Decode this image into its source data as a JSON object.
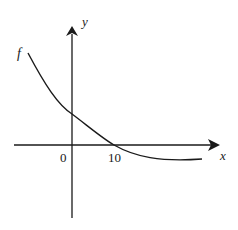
{
  "diagram": {
    "type": "function-graph",
    "function_label": "f",
    "x_axis_label": "x",
    "y_axis_label": "y",
    "tick_labels": [
      {
        "value": "0",
        "x": 64,
        "y": 162
      },
      {
        "value": "10",
        "x": 115,
        "y": 162
      }
    ],
    "colors": {
      "stroke": "#1a1a1a",
      "background": "#ffffff"
    }
  }
}
